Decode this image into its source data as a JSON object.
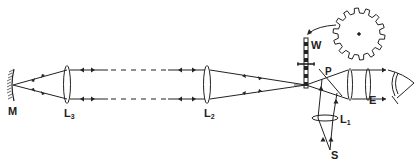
{
  "diagram": {
    "type": "optical-ray-diagram",
    "stroke_color": "#222222",
    "background": "#ffffff",
    "labels": {
      "mirror": "M",
      "lens3_main": "L",
      "lens3_sub": "3",
      "lens2_main": "L",
      "lens2_sub": "2",
      "lens1_main": "L",
      "lens1_sub": "1",
      "wheel": "W",
      "plate": "P",
      "eyepiece": "E",
      "source": "S"
    },
    "components": [
      {
        "id": "M",
        "name": "concave mirror"
      },
      {
        "id": "L3",
        "name": "collimating lens 3"
      },
      {
        "id": "L2",
        "name": "collimating lens 2"
      },
      {
        "id": "W",
        "name": "toothed wheel (edge view)"
      },
      {
        "id": "gear",
        "name": "toothed wheel (face view)"
      },
      {
        "id": "P",
        "name": "half-silvered plate"
      },
      {
        "id": "E",
        "name": "eyepiece"
      },
      {
        "id": "L1",
        "name": "condenser lens 1"
      },
      {
        "id": "S",
        "name": "light source"
      },
      {
        "id": "eye",
        "name": "observer eye"
      }
    ]
  }
}
